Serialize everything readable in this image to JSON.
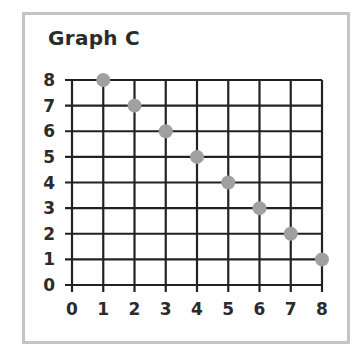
{
  "chart_data": {
    "type": "scatter",
    "title": "Graph C",
    "xlabel": "",
    "ylabel": "",
    "x": [
      1,
      2,
      3,
      4,
      5,
      6,
      7,
      8
    ],
    "y": [
      8,
      7,
      6,
      5,
      4,
      3,
      2,
      1
    ],
    "series": [
      {
        "name": "points",
        "points": [
          [
            1,
            8
          ],
          [
            2,
            7
          ],
          [
            3,
            6
          ],
          [
            4,
            5
          ],
          [
            5,
            4
          ],
          [
            6,
            3
          ],
          [
            7,
            2
          ],
          [
            8,
            1
          ]
        ]
      }
    ],
    "xlim": [
      0,
      8
    ],
    "ylim": [
      0,
      8
    ],
    "x_ticks": [
      "0",
      "1",
      "2",
      "3",
      "4",
      "5",
      "6",
      "7",
      "8"
    ],
    "y_ticks": [
      "0",
      "1",
      "2",
      "3",
      "4",
      "5",
      "6",
      "7",
      "8"
    ],
    "grid": true,
    "legend": null,
    "colors": {
      "point": "#a0a0a0",
      "grid": "#222222",
      "frame": "#c4c4c4",
      "text": "#2b2b2b"
    }
  }
}
